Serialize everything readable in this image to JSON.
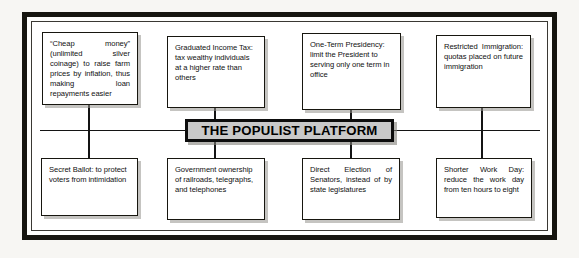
{
  "diagram": {
    "title": "THE POPULIST PLATFORM",
    "frame": {
      "border_color": "#16150f",
      "background_color": "#ffffff"
    },
    "banner": {
      "label": "THE POPULIST PLATFORM",
      "fill_color": "#c9c9c9",
      "border_color": "#0d0d0d"
    },
    "top_row": [
      {
        "name": "cheap-money",
        "text": "“Cheap money” (unlimited silver coinage) to raise farm prices by inflation, thus making loan repayments easier"
      },
      {
        "name": "graduated-income-tax",
        "text": "Graduated Income Tax: tax wealthy individuals at a higher rate than others"
      },
      {
        "name": "one-term-presidency",
        "text": "One-Term Presidency: limit the President to serving only one term in office"
      },
      {
        "name": "restricted-immigration",
        "text": "Restricted Immigration: quotas placed on future immigration"
      }
    ],
    "bottom_row": [
      {
        "name": "secret-ballot",
        "text": "Secret Ballot: to protect voters from intimidation"
      },
      {
        "name": "government-ownership",
        "text": "Government ownership of railroads, telegraphs, and telephones"
      },
      {
        "name": "direct-election-of-senators",
        "text": "Direct Election of Senators, instead of by state legislatures"
      },
      {
        "name": "shorter-work-day",
        "text": "Shorter Work Day: reduce the work day from ten hours to eight"
      }
    ]
  }
}
